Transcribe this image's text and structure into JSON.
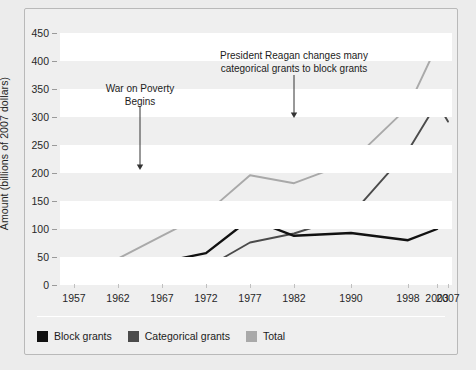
{
  "figure": {
    "background_color": "#efefef",
    "frame_border_color": "#b9b9b9"
  },
  "chart_data": {
    "type": "line",
    "title": "",
    "subtitle": "",
    "xlabel": "",
    "ylabel": "Amount (billions of 2007 dollars)",
    "categories": [
      "1957",
      "1962",
      "1967",
      "1972",
      "1977",
      "1982",
      "1990",
      "1998",
      "2003",
      "2007"
    ],
    "ylim": [
      0,
      470
    ],
    "yticks": [
      0,
      50,
      100,
      150,
      200,
      250,
      300,
      350,
      400,
      450
    ],
    "grid": "horizontal-bands",
    "legend_position": "bottom-left",
    "series": [
      {
        "name": "Block grants",
        "color": "#111111",
        "values": [
          14,
          24,
          41,
          57,
          118,
          88,
          93,
          80,
          100,
          140
        ]
      },
      {
        "name": "Categorical grants",
        "color": "#4b4b4b",
        "values": [
          12,
          20,
          30,
          31,
          76,
          92,
          125,
          240,
          325,
          292
        ]
      },
      {
        "name": "Total",
        "color": "#a9a9a9",
        "values": [
          26,
          47,
          88,
          128,
          196,
          182,
          220,
          318,
          428,
          435
        ]
      }
    ],
    "annotations": [
      {
        "id": "war-on-poverty",
        "line1": "War on Poverty",
        "line2": "Begins",
        "target_category": "1964",
        "arrow": "down"
      },
      {
        "id": "reagan-block-grants",
        "line1": "President Reagan changes many",
        "line2": "categorical grants to block grants",
        "target_category": "1982",
        "arrow": "down"
      }
    ]
  },
  "legend": {
    "items": [
      {
        "label": "Block grants",
        "color": "#111111"
      },
      {
        "label": "Categorical grants",
        "color": "#4b4b4b"
      },
      {
        "label": "Total",
        "color": "#a9a9a9"
      }
    ]
  }
}
